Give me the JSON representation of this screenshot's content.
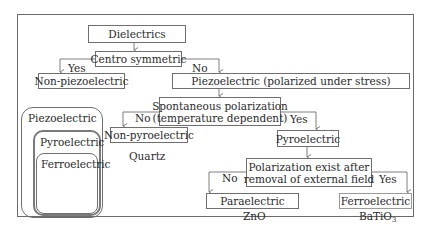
{
  "diagram": {
    "nodes": {
      "dielectrics": "Dielectrics",
      "centro": "Centro symmetric",
      "non_piezo": "Non-piezoelectric",
      "piezo": "Piezoelectric (polarized under stress)",
      "spont_line1": "Spontaneous polarization",
      "spont_line2": "(temperature dependent)",
      "non_pyro": "Non-pyroelectric",
      "pyro": "Pyroelectric",
      "pol_line1": "Polarization exist after",
      "pol_line2": "removal of external field",
      "para": "Paraelectric",
      "ferro": "Ferroelectric"
    },
    "edge_labels": {
      "centro_yes": "Yes",
      "centro_no": "No",
      "spont_no": "No",
      "spont_yes": "Yes",
      "pol_no": "No",
      "pol_yes": "Yes"
    },
    "examples": {
      "non_pyro": "Quartz",
      "para": "ZnO",
      "ferro_main": "BaTiO",
      "ferro_sub": "3"
    },
    "nested_sets": {
      "outer": "Piezoelectric",
      "middle": "Pyroelectric",
      "inner": "Ferroelectric"
    }
  }
}
